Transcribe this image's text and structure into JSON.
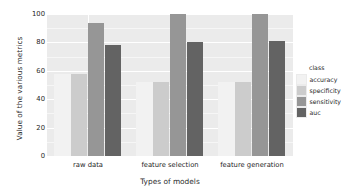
{
  "chart_data": {
    "type": "bar",
    "title": "",
    "xlabel": "Types of models",
    "ylabel": "Value of the various metrics",
    "categories": [
      "raw data",
      "feature selection",
      "feature generation"
    ],
    "series": [
      {
        "name": "accuracy",
        "color": "#F2F2F2",
        "values": [
          58,
          52,
          52
        ]
      },
      {
        "name": "specificity",
        "color": "#CCCCCC",
        "values": [
          58,
          52,
          52
        ]
      },
      {
        "name": "sensitivity",
        "color": "#969696",
        "values": [
          94,
          100,
          100
        ]
      },
      {
        "name": "auc",
        "color": "#636363",
        "values": [
          78,
          80,
          81
        ]
      }
    ],
    "legend_title": "class",
    "legend_position": "right",
    "ylim": [
      0,
      100
    ],
    "yticks": [
      0,
      20,
      40,
      60,
      80,
      100
    ],
    "ytick_labels": [
      "0",
      "20",
      "40",
      "60",
      "80",
      "100"
    ],
    "grid": true,
    "panel_background": "#EBEBEB",
    "grid_color": "#FFFFFF"
  }
}
